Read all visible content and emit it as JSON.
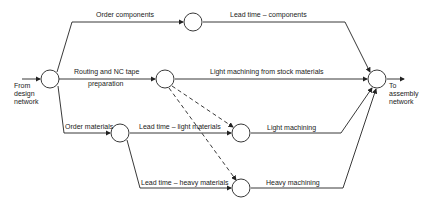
{
  "diagram": {
    "type": "activity-network",
    "nodes": [
      {
        "id": "start",
        "x": 50,
        "y": 79
      },
      {
        "id": "components",
        "x": 193,
        "y": 21
      },
      {
        "id": "routing",
        "x": 165,
        "y": 79
      },
      {
        "id": "end",
        "x": 377,
        "y": 79
      },
      {
        "id": "materials",
        "x": 120,
        "y": 133
      },
      {
        "id": "light",
        "x": 241,
        "y": 133
      },
      {
        "id": "heavy",
        "x": 241,
        "y": 188
      }
    ],
    "labels": {
      "from_design": "From\ndesign\nnetwork",
      "to_assembly": "To\nassembly\nnetwork",
      "order_components": "Order components",
      "lead_time_components": "Lead time – components",
      "routing_nc_1": "Routing and NC tape",
      "routing_nc_2": "preparation",
      "light_machining_stock": "Light machining from stock materials",
      "order_materials": "Order materials",
      "lead_time_light": "Lead time – light materials",
      "light_machining": "Light machining",
      "lead_time_heavy": "Lead time – heavy materials",
      "heavy_machining": "Heavy machining"
    }
  }
}
